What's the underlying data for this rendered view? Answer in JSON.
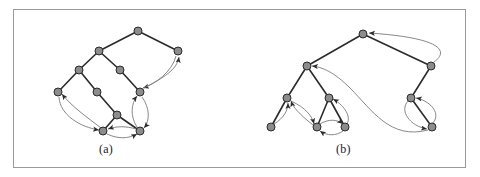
{
  "figure": {
    "border_color": "#9a9a9a",
    "background": "#ffffff",
    "panels": [
      {
        "id": "a",
        "caption": "(a)"
      },
      {
        "id": "b",
        "caption": "(b)"
      }
    ],
    "style": {
      "node_fill": "#8c8c8c",
      "node_stroke": "#2b2b2b",
      "node_radius": 4,
      "tree_edge_color": "#2b2b2b",
      "tree_edge_width": 1.6,
      "back_edge_color": "#7a7a7a",
      "back_edge_width": 0.9,
      "arrow_color": "#2b2b2b"
    }
  },
  "graph_a": {
    "caption": "(a)",
    "nodes": [
      {
        "id": "a0",
        "x": 138,
        "y": 31
      },
      {
        "id": "a1",
        "x": 99,
        "y": 51
      },
      {
        "id": "a2",
        "x": 178,
        "y": 51
      },
      {
        "id": "a3",
        "x": 79,
        "y": 70
      },
      {
        "id": "a4",
        "x": 120,
        "y": 70
      },
      {
        "id": "a5",
        "x": 58,
        "y": 92
      },
      {
        "id": "a6",
        "x": 97,
        "y": 92
      },
      {
        "id": "a7",
        "x": 140,
        "y": 92
      },
      {
        "id": "a8",
        "x": 117,
        "y": 115
      },
      {
        "id": "a9",
        "x": 103,
        "y": 131
      },
      {
        "id": "a10",
        "x": 140,
        "y": 131
      }
    ],
    "tree_edges": [
      [
        "a0",
        "a1"
      ],
      [
        "a0",
        "a2"
      ],
      [
        "a1",
        "a3"
      ],
      [
        "a1",
        "a4"
      ],
      [
        "a3",
        "a5"
      ],
      [
        "a3",
        "a6"
      ],
      [
        "a4",
        "a7"
      ],
      [
        "a6",
        "a8"
      ],
      [
        "a8",
        "a9"
      ],
      [
        "a8",
        "a10"
      ]
    ],
    "back_edges": [
      [
        "a2",
        "a7"
      ],
      [
        "a7",
        "a2"
      ],
      [
        "a5",
        "a9"
      ],
      [
        "a9",
        "a5"
      ],
      [
        "a7",
        "a10"
      ],
      [
        "a10",
        "a7"
      ],
      [
        "a9",
        "a10"
      ],
      [
        "a10",
        "a9"
      ]
    ]
  },
  "graph_b": {
    "caption": "(b)",
    "nodes": [
      {
        "id": "b0",
        "x": 363,
        "y": 34
      },
      {
        "id": "b1",
        "x": 307,
        "y": 66
      },
      {
        "id": "b2",
        "x": 431,
        "y": 66
      },
      {
        "id": "b3",
        "x": 287,
        "y": 98
      },
      {
        "id": "b4",
        "x": 329,
        "y": 98
      },
      {
        "id": "b5",
        "x": 411,
        "y": 98
      },
      {
        "id": "b6",
        "x": 271,
        "y": 127
      },
      {
        "id": "b7",
        "x": 317,
        "y": 127
      },
      {
        "id": "b8",
        "x": 345,
        "y": 127
      },
      {
        "id": "b9",
        "x": 432,
        "y": 127
      }
    ],
    "tree_edges": [
      [
        "b0",
        "b1"
      ],
      [
        "b0",
        "b2"
      ],
      [
        "b1",
        "b3"
      ],
      [
        "b1",
        "b4"
      ],
      [
        "b2",
        "b5"
      ],
      [
        "b3",
        "b6"
      ],
      [
        "b4",
        "b7"
      ],
      [
        "b4",
        "b8"
      ],
      [
        "b5",
        "b9"
      ]
    ],
    "back_edges": [
      [
        "b2",
        "b0"
      ],
      [
        "b6",
        "b3"
      ],
      [
        "b3",
        "b7"
      ],
      [
        "b7",
        "b4"
      ],
      [
        "b8",
        "b4"
      ],
      [
        "b7",
        "b8"
      ],
      [
        "b8",
        "b7"
      ],
      [
        "b9",
        "b5"
      ],
      [
        "b5",
        "b9"
      ],
      [
        "b9",
        "b1"
      ]
    ]
  }
}
